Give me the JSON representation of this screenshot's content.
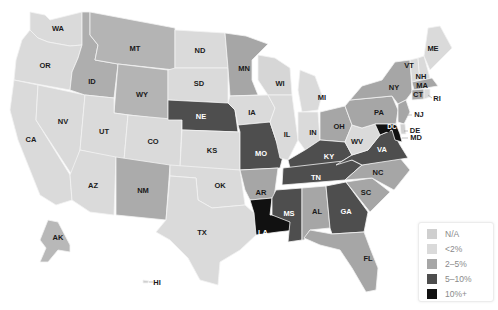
{
  "map": {
    "title": "",
    "type": "choropleth",
    "region": "United States"
  },
  "colors": {
    "na": "#cfcfcf",
    "lt2": "#dadada",
    "2to5": "#a6a6a6",
    "5to10": "#4e4e4e",
    "10plus": "#111111"
  },
  "legend": {
    "items": [
      {
        "label": "N/A",
        "color": "#cfcfcf"
      },
      {
        "label": "<2%",
        "color": "#dadada"
      },
      {
        "label": "2–5%",
        "color": "#a6a6a6"
      },
      {
        "label": "5–10%",
        "color": "#4e4e4e"
      },
      {
        "label": "10%+",
        "color": "#111111"
      }
    ]
  },
  "states": {
    "WA": {
      "label": "WA",
      "category": "<2%"
    },
    "OR": {
      "label": "OR",
      "category": "<2%"
    },
    "CA": {
      "label": "CA",
      "category": "<2%"
    },
    "NV": {
      "label": "NV",
      "category": "<2%"
    },
    "ID": {
      "label": "ID",
      "category": "2–5%"
    },
    "MT": {
      "label": "MT",
      "category": "2–5%"
    },
    "WY": {
      "label": "WY",
      "category": "2–5%"
    },
    "UT": {
      "label": "UT",
      "category": "<2%"
    },
    "AZ": {
      "label": "AZ",
      "category": "<2%"
    },
    "CO": {
      "label": "CO",
      "category": "<2%"
    },
    "NM": {
      "label": "NM",
      "category": "2–5%"
    },
    "ND": {
      "label": "ND",
      "category": "<2%"
    },
    "SD": {
      "label": "SD",
      "category": "<2%"
    },
    "NE": {
      "label": "NE",
      "category": "5–10%"
    },
    "KS": {
      "label": "KS",
      "category": "<2%"
    },
    "OK": {
      "label": "OK",
      "category": "<2%"
    },
    "TX": {
      "label": "TX",
      "category": "<2%"
    },
    "MN": {
      "label": "MN",
      "category": "2–5%"
    },
    "IA": {
      "label": "IA",
      "category": "<2%"
    },
    "MO": {
      "label": "MO",
      "category": "5–10%"
    },
    "AR": {
      "label": "AR",
      "category": "2–5%"
    },
    "LA": {
      "label": "LA",
      "category": "10%+"
    },
    "WI": {
      "label": "WI",
      "category": "<2%"
    },
    "IL": {
      "label": "IL",
      "category": "<2%"
    },
    "MI": {
      "label": "MI",
      "category": "<2%"
    },
    "IN": {
      "label": "IN",
      "category": "<2%"
    },
    "OH": {
      "label": "OH",
      "category": "2–5%"
    },
    "KY": {
      "label": "KY",
      "category": "5–10%"
    },
    "TN": {
      "label": "TN",
      "category": "5–10%"
    },
    "MS": {
      "label": "MS",
      "category": "5–10%"
    },
    "AL": {
      "label": "AL",
      "category": "2–5%"
    },
    "GA": {
      "label": "GA",
      "category": "5–10%"
    },
    "FL": {
      "label": "FL",
      "category": "2–5%"
    },
    "SC": {
      "label": "SC",
      "category": "2–5%"
    },
    "NC": {
      "label": "NC",
      "category": "2–5%"
    },
    "VA": {
      "label": "VA",
      "category": "5–10%"
    },
    "WV": {
      "label": "WV",
      "category": "<2%"
    },
    "PA": {
      "label": "PA",
      "category": "2–5%"
    },
    "NY": {
      "label": "NY",
      "category": "2–5%"
    },
    "VT": {
      "label": "VT",
      "category": "<2%"
    },
    "NH": {
      "label": "NH",
      "category": "<2%"
    },
    "ME": {
      "label": "ME",
      "category": "<2%"
    },
    "MA": {
      "label": "MA",
      "category": "2–5%"
    },
    "CT": {
      "label": "CT",
      "category": "2–5%"
    },
    "RI": {
      "label": "RI",
      "category": "<2%"
    },
    "NJ": {
      "label": "NJ",
      "category": "2–5%"
    },
    "DE": {
      "label": "DE",
      "category": "<2%"
    },
    "MD": {
      "label": "MD",
      "category": "10%+"
    },
    "DC": {
      "label": "DC",
      "category": "10%+"
    },
    "AK": {
      "label": "AK",
      "category": "<2%"
    },
    "HI": {
      "label": "HI",
      "category": "<2%"
    }
  }
}
